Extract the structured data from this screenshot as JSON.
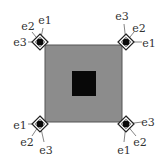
{
  "diagram": {
    "outer_square": {
      "x": 45,
      "y": 45,
      "w": 77,
      "h": 77,
      "fill": "#8c8c8c",
      "stroke": "#555555"
    },
    "inner_square": {
      "x": 72,
      "y": 71,
      "w": 24,
      "h": 25,
      "fill": "#080808"
    },
    "nodes": [
      {
        "id": "top-left",
        "cx": 40,
        "cy": 42,
        "labels": [
          {
            "text": "e1",
            "x": 45,
            "y": 20
          },
          {
            "text": "e2",
            "x": 28,
            "y": 26
          },
          {
            "text": "e3",
            "x": 20,
            "y": 42
          }
        ],
        "edges": [
          [
            40,
            42,
            43,
            28
          ],
          [
            40,
            42,
            32,
            32
          ],
          [
            40,
            42,
            28,
            42
          ]
        ]
      },
      {
        "id": "top-right",
        "cx": 126,
        "cy": 42,
        "labels": [
          {
            "text": "e3",
            "x": 122,
            "y": 16
          },
          {
            "text": "e2",
            "x": 139,
            "y": 28
          },
          {
            "text": "e1",
            "x": 149,
            "y": 43
          }
        ],
        "edges": [
          [
            126,
            42,
            124,
            24
          ],
          [
            126,
            42,
            134,
            32
          ],
          [
            126,
            42,
            142,
            42
          ]
        ]
      },
      {
        "id": "bottom-left",
        "cx": 40,
        "cy": 124,
        "labels": [
          {
            "text": "e1",
            "x": 20,
            "y": 125
          },
          {
            "text": "e2",
            "x": 27,
            "y": 142
          },
          {
            "text": "e3",
            "x": 46,
            "y": 150
          }
        ],
        "edges": [
          [
            40,
            124,
            28,
            124
          ],
          [
            40,
            124,
            32,
            136
          ],
          [
            40,
            124,
            44,
            142
          ]
        ]
      },
      {
        "id": "bottom-right",
        "cx": 126,
        "cy": 124,
        "labels": [
          {
            "text": "e3",
            "x": 148,
            "y": 122
          },
          {
            "text": "e2",
            "x": 140,
            "y": 142
          },
          {
            "text": "e1",
            "x": 124,
            "y": 150
          }
        ],
        "edges": [
          [
            126,
            124,
            142,
            122
          ],
          [
            126,
            124,
            136,
            136
          ],
          [
            126,
            124,
            124,
            142
          ]
        ]
      }
    ],
    "colors": {
      "diamond_stroke": "#222222",
      "diamond_fill": "#ffffff",
      "dot": "#0a0a0a",
      "edge": "#666666",
      "label": "#333333"
    }
  }
}
